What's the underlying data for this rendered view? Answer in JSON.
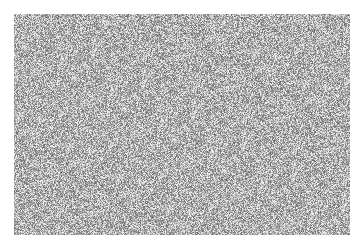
{
  "image": {
    "description": "Grayscale random noise texture",
    "palette": {
      "background": "#ffffff",
      "noise_light": "#e6e6e6",
      "noise_mid": "#a8a8a8",
      "noise_dark": "#6e6e6e"
    }
  }
}
